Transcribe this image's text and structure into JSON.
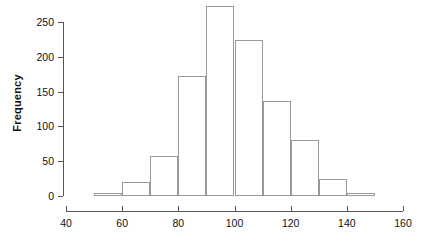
{
  "chart_data": {
    "type": "bar",
    "title": "",
    "subtitle": "",
    "xlabel": "",
    "ylabel": "Frequency",
    "grid": false,
    "legend": false,
    "legend_position": "none",
    "bin_width": 10,
    "bin_edges": [
      50,
      60,
      70,
      80,
      90,
      100,
      110,
      120,
      130,
      140,
      150
    ],
    "categories": [
      "50-60",
      "60-70",
      "70-80",
      "80-90",
      "90-100",
      "100-110",
      "110-120",
      "120-130",
      "130-140",
      "140-150"
    ],
    "x": [
      55,
      65,
      75,
      85,
      95,
      105,
      115,
      125,
      135,
      145
    ],
    "values": [
      5,
      20,
      58,
      173,
      273,
      224,
      137,
      81,
      24,
      5
    ],
    "xlim": [
      40,
      160
    ],
    "ylim": [
      0,
      280
    ],
    "xticks": [
      40,
      60,
      80,
      100,
      120,
      140,
      160
    ],
    "xtick_labels": [
      "40",
      "60",
      "80",
      "100",
      "120",
      "140",
      "160"
    ],
    "yticks": [
      0,
      50,
      100,
      150,
      200,
      250
    ],
    "ytick_labels": [
      "0",
      "50",
      "100",
      "150",
      "200",
      "250"
    ],
    "annotations": [],
    "colors": {
      "bar_fill": "#ffffff",
      "bar_edge": "#9a9a9a",
      "axis": "#555555",
      "text": "#111111",
      "background": "#ffffff"
    }
  },
  "geometry": {
    "plot_left_px": 66,
    "plot_right_px": 403,
    "x_data_min": 40,
    "x_data_max": 160,
    "y_zero_px": 196,
    "y_top_px": 22,
    "y_data_at_top": 250
  }
}
